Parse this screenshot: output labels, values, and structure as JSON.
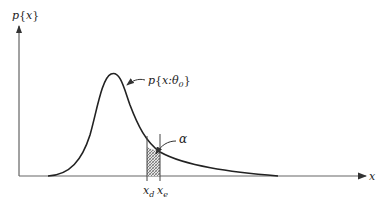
{
  "diagram": {
    "type": "probability-density-curve",
    "y_axis_label": "p{x}",
    "x_axis_label": "x",
    "curve_label": "p{x:θ₀}",
    "curve_label_parts": {
      "base": "p",
      "open": "{",
      "var": "x:θ",
      "sub": "0",
      "close": "}"
    },
    "y_label_parts": {
      "base": "p",
      "open": "{",
      "var": "x",
      "close": "}"
    },
    "shaded_region_label": "α",
    "markers": [
      {
        "id": "xd",
        "base": "x",
        "sub": "d"
      },
      {
        "id": "xe",
        "base": "x",
        "sub": "e"
      }
    ],
    "colors": {
      "line": "#222222",
      "axis": "#444444",
      "hatch": "#555555"
    }
  }
}
